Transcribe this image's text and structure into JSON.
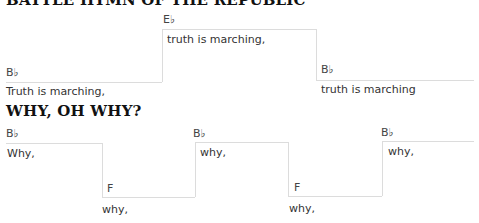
{
  "sections": [
    {
      "title": "BATTLE HYMN OF THE REPUBLIC",
      "steps": [
        {
          "chord": "B♭",
          "lyric": "Truth is marching,"
        },
        {
          "chord": "E♭",
          "lyric": "truth is marching,"
        },
        {
          "chord": "B♭",
          "lyric": "truth is marching"
        }
      ]
    },
    {
      "title": "WHY, OH WHY?",
      "steps": [
        {
          "chord": "B♭",
          "lyric": "Why,"
        },
        {
          "chord": "F",
          "lyric": "why,"
        },
        {
          "chord": "B♭",
          "lyric": "why,"
        },
        {
          "chord": "F",
          "lyric": "why,"
        },
        {
          "chord": "B♭",
          "lyric": "why,"
        }
      ]
    }
  ]
}
